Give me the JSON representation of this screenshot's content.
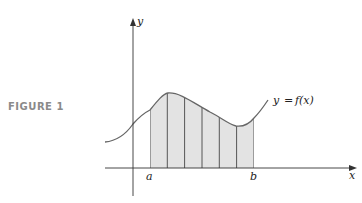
{
  "figure": {
    "label": "FIGURE 1"
  },
  "diagram": {
    "x_axis_label": "x",
    "y_axis_label": "y",
    "left_bound_label": "a",
    "right_bound_label": "b",
    "curve_label_lhs": "y",
    "curve_label_eq": "=",
    "curve_label_rhs": "f(x)",
    "strip_count": 6,
    "colors": {
      "fill": "#e3e3e3",
      "stroke": "#555555",
      "curve": "#666666",
      "axis": "#333333",
      "figure_label": "#8a8a8a"
    }
  }
}
